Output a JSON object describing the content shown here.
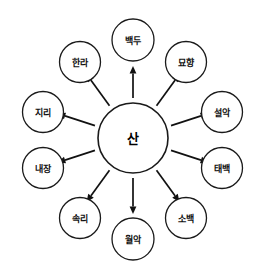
{
  "diagram": {
    "type": "radial-mind-map",
    "title": "",
    "background_color": "#ffffff",
    "stroke_color": "#1a1a1a",
    "text_color": "#111111",
    "center": {
      "id": "center-node",
      "label": "산",
      "cx": 133,
      "cy": 138,
      "r": 35
    },
    "layout": {
      "spoke_radius": 101,
      "spoke_node_radius": 19.5,
      "arrow_start_radius": 40,
      "arrow_end_radius": 78,
      "node_count": 10,
      "arrow_direction": "outward-from-center"
    },
    "nodes": [
      {
        "id": "node-baekdu",
        "label": "백두",
        "angle_deg": 90,
        "cx": 133,
        "cy": 40,
        "r": 21,
        "arrow_start_r": 40,
        "arrow_end_r": 72
      },
      {
        "id": "node-myohyang",
        "label": "묘향",
        "angle_deg": 54,
        "cx": 186,
        "cy": 62,
        "r": 20.5,
        "arrow_start_r": 40,
        "arrow_end_r": 79
      },
      {
        "id": "node-seorak",
        "label": "설악",
        "angle_deg": 18,
        "cx": 222,
        "cy": 112,
        "r": 20.5,
        "arrow_start_r": 40,
        "arrow_end_r": 79
      },
      {
        "id": "node-taebaek",
        "label": "태백",
        "angle_deg": 342,
        "cx": 222,
        "cy": 168,
        "r": 20.5,
        "arrow_start_r": 40,
        "arrow_end_r": 79
      },
      {
        "id": "node-sobaek",
        "label": "소백",
        "angle_deg": 306,
        "cx": 186,
        "cy": 218,
        "r": 20.5,
        "arrow_start_r": 40,
        "arrow_end_r": 79
      },
      {
        "id": "node-worak",
        "label": "월악",
        "angle_deg": 270,
        "cx": 133,
        "cy": 239,
        "r": 21,
        "arrow_start_r": 40,
        "arrow_end_r": 76
      },
      {
        "id": "node-songni",
        "label": "속리",
        "angle_deg": 234,
        "cx": 80,
        "cy": 218,
        "r": 20.5,
        "arrow_start_r": 40,
        "arrow_end_r": 79
      },
      {
        "id": "node-naejang",
        "label": "내장",
        "angle_deg": 198,
        "cx": 43,
        "cy": 168,
        "r": 20.5,
        "arrow_start_r": 40,
        "arrow_end_r": 79
      },
      {
        "id": "node-jiri",
        "label": "지리",
        "angle_deg": 162,
        "cx": 43,
        "cy": 112,
        "r": 20.5,
        "arrow_start_r": 40,
        "arrow_end_r": 79
      },
      {
        "id": "node-halla",
        "label": "한라",
        "angle_deg": 126,
        "cx": 80,
        "cy": 62,
        "r": 20.5,
        "arrow_start_r": 40,
        "arrow_end_r": 79
      }
    ]
  }
}
